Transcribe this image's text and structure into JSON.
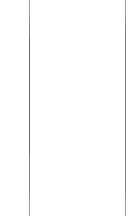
{
  "canvas": {
    "width": 132,
    "height": 216,
    "background_color": "#ffffff"
  },
  "panel": {
    "state": "empty",
    "content_text": "",
    "left_rule_color": "#8a8a8a",
    "right_rule_color": "#8a8a8a"
  },
  "rules": [
    {
      "name": "left-divider",
      "orientation": "vertical",
      "x": 29,
      "y_start": 0,
      "y_end": 216,
      "thickness": 1,
      "color": "#8a8a8a"
    },
    {
      "name": "right-divider",
      "orientation": "vertical",
      "x": 125,
      "y_start": 0,
      "y_end": 216,
      "thickness": 1,
      "color": "#8a8a8a"
    }
  ]
}
